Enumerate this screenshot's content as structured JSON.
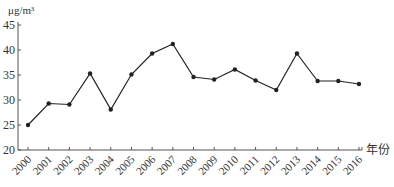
{
  "chart_data": {
    "type": "line",
    "title": "",
    "ylabel": "μg/m³",
    "xlabel": "年份",
    "categories": [
      "2000",
      "2001",
      "2002",
      "2003",
      "2004",
      "2005",
      "2006",
      "2007",
      "2008",
      "2009",
      "2010",
      "2011",
      "2012",
      "2013",
      "2014",
      "2015",
      "2016"
    ],
    "series": [
      {
        "name": "",
        "values": [
          25.0,
          29.3,
          29.1,
          35.3,
          28.1,
          35.1,
          39.3,
          41.2,
          34.6,
          34.1,
          36.1,
          33.9,
          32.0,
          39.3,
          33.8,
          33.8,
          33.2
        ]
      }
    ],
    "yticks": [
      20,
      25,
      30,
      35,
      40,
      45
    ],
    "ylim": [
      20,
      45
    ],
    "grid": false,
    "legend": null,
    "line_color": "#222222",
    "marker": "filled-circle"
  }
}
